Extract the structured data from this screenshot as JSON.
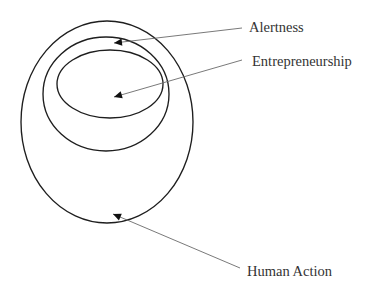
{
  "diagram": {
    "type": "nested-ellipses",
    "background": "#ffffff",
    "stroke_color": "#1e1e1e",
    "leader_color": "#6a6a6a",
    "text_color": "#333333",
    "sets": [
      {
        "id": "human-action",
        "label": "Human Action",
        "level": "outer",
        "ellipse": {
          "cx": 107,
          "cy": 122,
          "rx": 86,
          "ry": 101
        },
        "arrow": {
          "from": [
            240,
            268
          ],
          "to": [
            113,
            214
          ]
        },
        "text_pos": [
          247,
          276
        ]
      },
      {
        "id": "alertness",
        "label": "Alertness",
        "level": "middle",
        "ellipse": {
          "cx": 106,
          "cy": 94,
          "rx": 63,
          "ry": 57
        },
        "arrow": {
          "from": [
            242,
            28
          ],
          "to": [
            114,
            43
          ]
        },
        "text_pos": [
          249,
          32
        ]
      },
      {
        "id": "entrepreneurship",
        "label": "Entrepreneurship",
        "level": "inner",
        "ellipse": {
          "cx": 110,
          "cy": 84,
          "rx": 53,
          "ry": 34
        },
        "arrow": {
          "from": [
            242,
            60
          ],
          "to": [
            114,
            97
          ]
        },
        "text_pos": [
          252,
          66
        ]
      }
    ],
    "relationships": [
      {
        "subset": "Entrepreneurship",
        "of": "Alertness"
      },
      {
        "subset": "Alertness",
        "of": "Human Action"
      }
    ]
  }
}
